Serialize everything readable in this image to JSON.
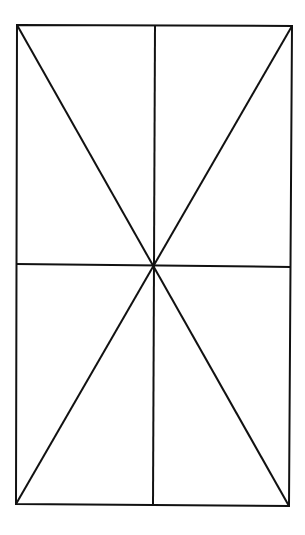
{
  "diagram": {
    "canvas": {
      "width": 305,
      "height": 535,
      "background": "#ffffff"
    },
    "stroke": {
      "color": "#111111",
      "width": 2
    },
    "rectangle": {
      "top_left": [
        17,
        25
      ],
      "top_right": [
        292,
        26
      ],
      "bottom_right": [
        289,
        506
      ],
      "bottom_left": [
        16,
        504
      ]
    },
    "center": [
      153,
      266
    ],
    "lines": [
      {
        "name": "diagonal-tl-br",
        "from": [
          17,
          25
        ],
        "to": [
          289,
          506
        ]
      },
      {
        "name": "diagonal-tr-bl",
        "from": [
          292,
          26
        ],
        "to": [
          16,
          504
        ]
      },
      {
        "name": "vertical-midline",
        "from": [
          155,
          25
        ],
        "to": [
          153,
          505
        ]
      },
      {
        "name": "horizontal-midline",
        "from": [
          16,
          264
        ],
        "to": [
          291,
          267
        ]
      }
    ]
  }
}
